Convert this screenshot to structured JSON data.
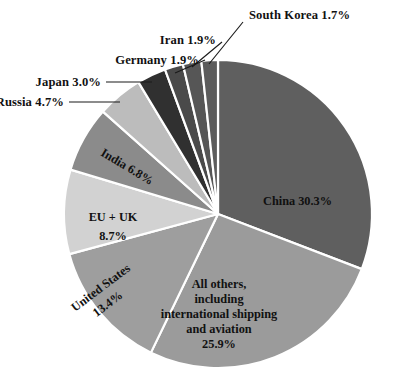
{
  "chart_data": {
    "type": "pie",
    "title": "",
    "subtitle": "",
    "xlabel": "",
    "ylabel": "",
    "legend_position": "none",
    "grid": false,
    "units": "percent",
    "categories": [
      "China",
      "All others, including international shipping and aviation",
      "United States",
      "EU + UK",
      "India",
      "Russia",
      "Japan",
      "Germany",
      "Iran",
      "South Korea"
    ],
    "values": [
      30.3,
      25.9,
      13.4,
      8.7,
      6.8,
      4.7,
      3.0,
      1.9,
      1.9,
      1.7
    ],
    "colors": [
      "#5f5f5f",
      "#9b9b9b",
      "#9e9e9e",
      "#d2d2d2",
      "#8b8b8b",
      "#bcbcbc",
      "#303030",
      "#4a4a4a",
      "#565656",
      "#5c5c5c"
    ],
    "start_angle_deg": 0,
    "direction": "clockwise"
  },
  "slices": [
    {
      "name": "china",
      "label": "China 30.3%",
      "value": 30.3,
      "percent_text": "30.3%",
      "color": "#5f5f5f",
      "label_placement": "inside"
    },
    {
      "name": "all-others",
      "label": "All others, including international shipping and aviation 25.9%",
      "value": 25.9,
      "percent_text": "25.9%",
      "color": "#9b9b9b",
      "label_placement": "inside",
      "label_lines": [
        "All others,",
        "including",
        "international shipping",
        "and aviation",
        "25.9%"
      ]
    },
    {
      "name": "united-states",
      "label": "United States 13.4%",
      "value": 13.4,
      "percent_text": "13.4%",
      "color": "#9e9e9e",
      "label_placement": "inside",
      "label_lines": [
        "United States",
        "13.4%"
      ]
    },
    {
      "name": "eu-uk",
      "label": "EU + UK 8.7%",
      "value": 8.7,
      "percent_text": "8.7%",
      "color": "#d2d2d2",
      "label_placement": "inside",
      "label_lines": [
        "EU + UK",
        "8.7%"
      ]
    },
    {
      "name": "india",
      "label": "India 6.8%",
      "value": 6.8,
      "percent_text": "6.8%",
      "color": "#8b8b8b",
      "label_placement": "inside"
    },
    {
      "name": "russia",
      "label": "Russia 4.7%",
      "value": 4.7,
      "percent_text": "4.7%",
      "color": "#bcbcbc",
      "label_placement": "outside"
    },
    {
      "name": "japan",
      "label": "Japan 3.0%",
      "value": 3.0,
      "percent_text": "3.0%",
      "color": "#303030",
      "label_placement": "outside"
    },
    {
      "name": "germany",
      "label": "Germany 1.9%",
      "value": 1.9,
      "percent_text": "1.9%",
      "color": "#4a4a4a",
      "label_placement": "outside"
    },
    {
      "name": "iran",
      "label": "Iran 1.9%",
      "value": 1.9,
      "percent_text": "1.9%",
      "color": "#565656",
      "label_placement": "outside"
    },
    {
      "name": "south-korea",
      "label": "South Korea 1.7%",
      "value": 1.7,
      "percent_text": "1.7%",
      "color": "#5c5c5c",
      "label_placement": "outside"
    }
  ],
  "all_others_lines": {
    "l1": "All others,",
    "l2": "including",
    "l3": "international shipping",
    "l4": "and aviation",
    "l5": "25.9%"
  },
  "united_states_lines": {
    "l1": "United States",
    "l2": "13.4%"
  },
  "eu_uk_lines": {
    "l1": "EU + UK",
    "l2": "8.7%"
  },
  "outside_labels": {
    "south_korea": "South Korea 1.7%",
    "iran": "Iran 1.9%",
    "germany": "Germany 1.9%",
    "japan": "Japan 3.0%",
    "russia": "Russia 4.7%"
  },
  "inside_labels": {
    "china": "China 30.3%",
    "india": "India 6.8%"
  }
}
